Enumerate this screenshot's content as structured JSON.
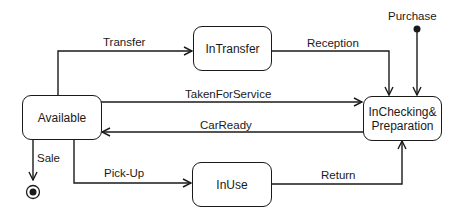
{
  "diagram": {
    "type": "state-machine",
    "states": {
      "available": "Available",
      "in_transfer": "InTransfer",
      "in_use": "InUse",
      "in_checking_line1": "InChecking&",
      "in_checking_line2": "Preparation"
    },
    "pseudostates": {
      "initial_label": "Purchase",
      "final": "final-state"
    },
    "transitions": {
      "transfer": "Transfer",
      "reception": "Reception",
      "taken_for_service": "TakenForService",
      "car_ready": "CarReady",
      "sale": "Sale",
      "pick_up": "Pick-Up",
      "return": "Return"
    },
    "edges": [
      {
        "from": "Available",
        "to": "InTransfer",
        "label": "Transfer"
      },
      {
        "from": "InTransfer",
        "to": "InChecking&Preparation",
        "label": "Reception"
      },
      {
        "from": "initial",
        "to": "InChecking&Preparation",
        "label": "Purchase"
      },
      {
        "from": "Available",
        "to": "InChecking&Preparation",
        "label": "TakenForService"
      },
      {
        "from": "InChecking&Preparation",
        "to": "Available",
        "label": "CarReady"
      },
      {
        "from": "Available",
        "to": "final",
        "label": "Sale"
      },
      {
        "from": "Available",
        "to": "InUse",
        "label": "Pick-Up"
      },
      {
        "from": "InUse",
        "to": "InChecking&Preparation",
        "label": "Return"
      }
    ],
    "colors": {
      "stroke": "#1a1a1a",
      "background": "#ffffff"
    }
  }
}
